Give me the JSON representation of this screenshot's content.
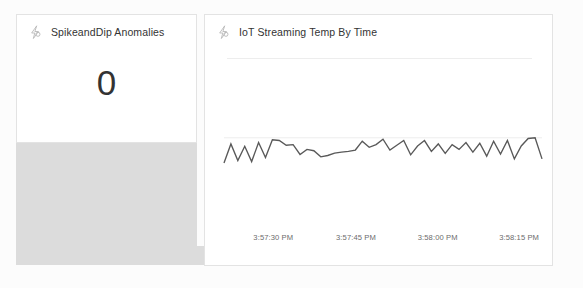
{
  "page": {
    "background_color": "#fcfcfc",
    "surface_color": "#dcdcdc",
    "card_color": "#ffffff",
    "card_border_color": "#e3e3e3",
    "text_color": "#333333",
    "muted_text_color": "#6b6b6b",
    "line_color": "#595959"
  },
  "kpi_tile": {
    "icon": "lightning-bolt-icon",
    "title": "SpikeandDip Anomalies",
    "value": "0"
  },
  "chart_tile": {
    "icon": "lightning-bolt-icon",
    "title": "IoT Streaming Temp By Time"
  },
  "chart_data": {
    "type": "line",
    "title": "IoT Streaming Temp By Time",
    "xlabel": "",
    "ylabel": "",
    "grid": true,
    "legend": false,
    "xtick_labels": [
      "3:57:30 PM",
      "3:57:45 PM",
      "3:58:00 PM",
      "3:58:15 PM"
    ],
    "xtick_positions": [
      0.155,
      0.415,
      0.672,
      0.928
    ],
    "series": [
      {
        "name": "Temp",
        "color": "#595959",
        "x": [
          0,
          1,
          2,
          3,
          4,
          5,
          6,
          7,
          8,
          9,
          10,
          11,
          12,
          13,
          14,
          15,
          16,
          17,
          18,
          19,
          20,
          21,
          22,
          23,
          24,
          25,
          26,
          27,
          28,
          29,
          30,
          31,
          32,
          33,
          34,
          35,
          36,
          37,
          38,
          39,
          40,
          41,
          42,
          43,
          44,
          45,
          46
        ],
        "values": [
          0.06,
          0.62,
          0.13,
          0.55,
          0.1,
          0.66,
          0.22,
          0.74,
          0.72,
          0.58,
          0.6,
          0.31,
          0.46,
          0.42,
          0.24,
          0.28,
          0.35,
          0.38,
          0.4,
          0.44,
          0.7,
          0.52,
          0.6,
          0.76,
          0.44,
          0.58,
          0.72,
          0.3,
          0.56,
          0.72,
          0.4,
          0.62,
          0.34,
          0.6,
          0.46,
          0.66,
          0.38,
          0.64,
          0.26,
          0.7,
          0.32,
          0.72,
          0.18,
          0.56,
          0.78,
          0.8,
          0.18
        ]
      }
    ],
    "gridlines_y": [
      0.8
    ]
  }
}
